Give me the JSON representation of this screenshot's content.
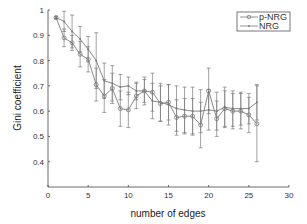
{
  "chart_data": {
    "type": "line",
    "title": "",
    "xlabel": "number of edges",
    "ylabel": "Gini coefficient",
    "xlim": [
      0,
      30
    ],
    "ylim": [
      0.3,
      1.0
    ],
    "xticks": [
      0,
      5,
      10,
      15,
      20,
      25,
      30
    ],
    "yticks": [
      0.4,
      0.5,
      0.6,
      0.7,
      0.8,
      0.9,
      1
    ],
    "ytick_labels": [
      "0.4",
      "0.5",
      "0.6",
      "0.7",
      "0.8",
      "0.9",
      "1"
    ],
    "grid": false,
    "legend_position": "upper right",
    "x": [
      1,
      2,
      3,
      4,
      5,
      6,
      7,
      8,
      9,
      10,
      11,
      12,
      13,
      14,
      15,
      16,
      17,
      18,
      19,
      20,
      21,
      22,
      23,
      24,
      25,
      26
    ],
    "series": [
      {
        "name": "p-NRG",
        "marker": "circle",
        "values": [
          0.97,
          0.89,
          0.87,
          0.825,
          0.805,
          0.705,
          0.66,
          0.69,
          0.61,
          0.605,
          0.66,
          0.68,
          0.675,
          0.63,
          0.635,
          0.575,
          0.58,
          0.58,
          0.545,
          0.68,
          0.57,
          0.61,
          0.6,
          0.6,
          0.585,
          0.55
        ],
        "error": [
          0.005,
          0.035,
          0.03,
          0.05,
          0.05,
          0.065,
          0.065,
          0.06,
          0.07,
          0.07,
          0.05,
          0.055,
          0.075,
          0.07,
          0.07,
          0.07,
          0.07,
          0.07,
          0.09,
          0.09,
          0.07,
          0.07,
          0.07,
          0.07,
          0.07,
          0.15
        ]
      },
      {
        "name": "NRG",
        "marker": "dot",
        "values": [
          0.97,
          0.955,
          0.915,
          0.885,
          0.845,
          0.8,
          0.72,
          0.71,
          0.695,
          0.7,
          0.68,
          0.68,
          0.64,
          0.635,
          0.625,
          0.61,
          0.605,
          0.6,
          0.6,
          0.605,
          0.6,
          0.615,
          0.61,
          0.61,
          0.61,
          0.635
        ],
        "error": [
          0.005,
          0.04,
          0.065,
          0.05,
          0.05,
          0.11,
          0.07,
          0.07,
          0.05,
          0.035,
          0.035,
          0.045,
          0.07,
          0.075,
          0.08,
          0.09,
          0.09,
          0.095,
          0.085,
          0.08,
          0.075,
          0.08,
          0.07,
          0.065,
          0.06,
          0.07
        ]
      }
    ]
  },
  "legend": {
    "items": [
      {
        "label": "p-NRG"
      },
      {
        "label": "NRG"
      }
    ]
  },
  "colors": {
    "series": "#7a7a7a",
    "axis": "#444444"
  }
}
